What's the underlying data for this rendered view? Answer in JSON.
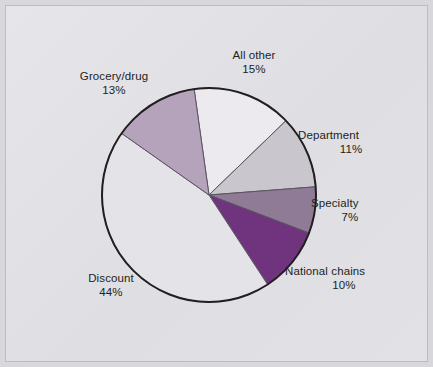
{
  "figure": {
    "background_color": "#d8d8dc",
    "panel_color": "#e3e3e7",
    "border_color": "#bcbcc2"
  },
  "chart_data": {
    "type": "pie",
    "title": "",
    "subtitle": "",
    "xlabel": "",
    "ylabel": "",
    "legend_position": "none",
    "grid": false,
    "labels_show_percent": true,
    "start_angle_deg": -8,
    "direction": "clockwise",
    "center": {
      "x": 203,
      "y": 189
    },
    "radius": 107,
    "outline_color": "#231f20",
    "outline_width": 2,
    "separator_color": "#5a5560",
    "separator_width": 1,
    "categories": [
      "All other",
      "Department",
      "Specialty",
      "National chains",
      "Discount",
      "Grocery/drug"
    ],
    "values": [
      15,
      11,
      7,
      10,
      44,
      13
    ],
    "colors": [
      "#eceaef",
      "#c9c6cd",
      "#8f7b95",
      "#70347f",
      "#e4e3e8",
      "#b5a2bb"
    ],
    "slices": [
      {
        "name": "All other",
        "percent": 15,
        "percent_text": "15%",
        "color": "#eceaef"
      },
      {
        "name": "Department",
        "percent": 11,
        "percent_text": "11%",
        "color": "#c9c6cd"
      },
      {
        "name": "Specialty",
        "percent": 7,
        "percent_text": "7%",
        "color": "#8f7b95"
      },
      {
        "name": "National chains",
        "percent": 10,
        "percent_text": "10%",
        "color": "#70347f"
      },
      {
        "name": "Discount",
        "percent": 44,
        "percent_text": "44%",
        "color": "#e4e3e8"
      },
      {
        "name": "Grocery/drug",
        "percent": 13,
        "percent_text": "13%",
        "color": "#b5a2bb"
      }
    ]
  }
}
